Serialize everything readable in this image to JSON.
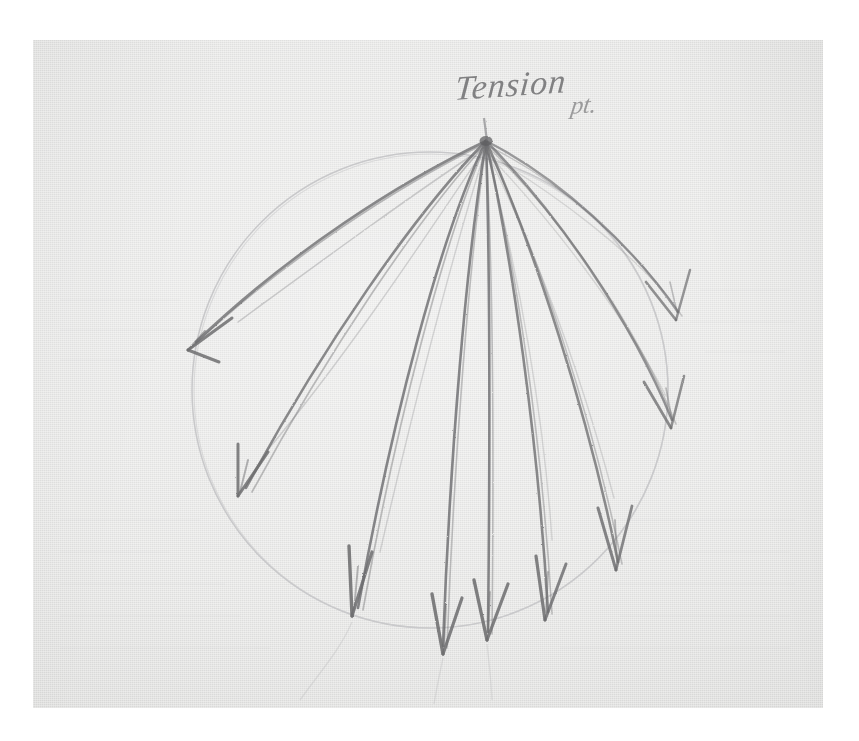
{
  "medium": {
    "surface": "paper",
    "tool": "graphite pencil",
    "background_color": "#ffffff",
    "paper_color": "#e3e3e1",
    "pencil_color": "#6e6e70",
    "faint_pencil_color": "#b9b9bb"
  },
  "paper": {
    "x": 33,
    "y": 40,
    "width": 790,
    "height": 668
  },
  "annotations": {
    "title_label": "Tension",
    "title_suffix": "pt.",
    "title_full": "Tension pt.",
    "label_x": 455,
    "label_y": 66
  },
  "chart_data": {
    "type": "diagram",
    "apex": {
      "x": 486,
      "y": 141,
      "label": "Tension pt."
    },
    "circle": {
      "cx": 430,
      "cy": 390,
      "r": 238,
      "stroke": "#c0c0c2",
      "note": "faint construction circle"
    },
    "arrow_count": 9,
    "arrows": [
      {
        "id": 1,
        "angle_deg": 212,
        "tip_x": 188,
        "tip_y": 350,
        "bow": 42,
        "doubled": true
      },
      {
        "id": 2,
        "angle_deg": 232,
        "tip_x": 238,
        "tip_y": 496,
        "bow": 30,
        "doubled": true
      },
      {
        "id": 3,
        "angle_deg": 249,
        "tip_x": 352,
        "tip_y": 616,
        "bow": 20,
        "doubled": true
      },
      {
        "id": 4,
        "angle_deg": 262,
        "tip_x": 443,
        "tip_y": 654,
        "bow": 10,
        "doubled": false
      },
      {
        "id": 5,
        "angle_deg": 272,
        "tip_x": 487,
        "tip_y": 640,
        "bow": 0,
        "doubled": false
      },
      {
        "id": 6,
        "angle_deg": 285,
        "tip_x": 545,
        "tip_y": 620,
        "bow": -14,
        "doubled": true
      },
      {
        "id": 7,
        "angle_deg": 300,
        "tip_x": 616,
        "tip_y": 570,
        "bow": -22,
        "doubled": true
      },
      {
        "id": 8,
        "angle_deg": 318,
        "tip_x": 671,
        "tip_y": 428,
        "bow": -30,
        "doubled": true
      },
      {
        "id": 9,
        "angle_deg": 334,
        "tip_x": 676,
        "tip_y": 320,
        "bow": -34,
        "doubled": true
      }
    ],
    "ghost_lines": [
      {
        "note": "faint show-through marks below circle",
        "opacity": 0.12
      }
    ]
  }
}
